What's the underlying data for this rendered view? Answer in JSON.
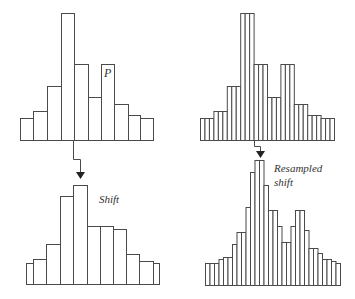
{
  "labels": {
    "p": "P",
    "shift": "Shift",
    "resampled_line1": "Resampled",
    "resampled_line2": "shift"
  },
  "colors": {
    "stroke": "#4a4a4a",
    "text": "#333333",
    "background": "#ffffff"
  },
  "histograms": {
    "top_left": {
      "baseline": 140,
      "edges": [
        20,
        33,
        47,
        61,
        74,
        88,
        101,
        114,
        128,
        140,
        153
      ],
      "tops": [
        118,
        111,
        86,
        13,
        64,
        97,
        64,
        104,
        115,
        118
      ]
    },
    "bottom_left": {
      "baseline": 284,
      "edges": [
        26,
        33,
        46,
        60,
        73,
        87,
        100,
        113,
        126,
        139,
        153,
        159
      ],
      "tops": [
        263,
        259,
        244,
        196,
        185,
        226,
        226,
        229,
        254,
        261,
        263
      ]
    },
    "top_right": {
      "baseline": 140,
      "x0": 200,
      "x1": 334,
      "subdivisions": 3,
      "tops": [
        118,
        111,
        86,
        13,
        64,
        97,
        64,
        104,
        115,
        118
      ]
    },
    "bottom_right": {
      "baseline": 285,
      "x0": 205,
      "x1": 340,
      "tops": [
        263,
        263,
        263,
        259,
        257,
        257,
        244,
        232,
        232,
        207,
        172,
        160,
        160,
        185,
        210,
        210,
        226,
        242,
        242,
        226,
        210,
        210,
        230,
        248,
        248,
        253,
        259,
        259,
        261,
        263
      ]
    }
  },
  "arrows": {
    "left": [
      [
        73,
        140
      ],
      [
        73,
        159
      ],
      [
        80,
        159
      ],
      [
        80,
        179
      ]
    ],
    "right": [
      [
        254,
        140
      ],
      [
        254,
        146
      ],
      [
        260,
        146
      ],
      [
        260,
        158
      ]
    ]
  }
}
